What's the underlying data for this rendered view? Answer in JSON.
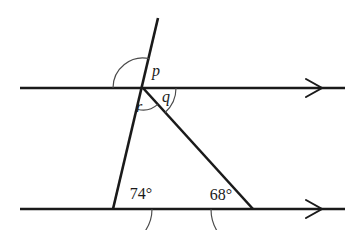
{
  "figure": {
    "type": "geometry-diagram",
    "background_color": "#ffffff",
    "line_color": "#1a1a1a",
    "arc_color": "#4a4a4a"
  },
  "lines": {
    "top_parallel": {
      "name": "top parallel line",
      "x1": 20,
      "y1": 88,
      "x2": 345,
      "y2": 88,
      "arrow_direction": "right",
      "arrow_x": 322,
      "arrow_count": 1
    },
    "bottom_parallel": {
      "name": "bottom parallel line",
      "x1": 20,
      "y1": 209,
      "x2": 345,
      "y2": 209,
      "arrow_direction": "right",
      "arrow_x": 322,
      "arrow_count": 1
    },
    "transversal": {
      "name": "transversal line",
      "x1": 158,
      "y1": 18,
      "x2": 113,
      "y2": 209
    },
    "right_leg": {
      "name": "right leg",
      "x1": 143,
      "y1": 88,
      "x2": 253,
      "y2": 209
    }
  },
  "points": {
    "intersection": {
      "x": 143,
      "y": 88,
      "label": "intersection on top line"
    },
    "bottom_left_vertex": {
      "x": 113,
      "y": 209,
      "label": "bottom left vertex"
    },
    "bottom_right_vertex": {
      "x": 253,
      "y": 209,
      "label": "bottom right vertex"
    }
  },
  "angles": [
    {
      "id": "p",
      "label": "p",
      "kind": "variable",
      "vertex": {
        "x": 143,
        "y": 88
      },
      "label_pos": {
        "x": 156,
        "y": 72
      },
      "arc_radius": 30,
      "start_deg": 180,
      "end_deg": 283,
      "description": "angle above top line, between transversal and line going right"
    },
    {
      "id": "q",
      "label": "q",
      "kind": "variable",
      "vertex": {
        "x": 143,
        "y": 88
      },
      "label_pos": {
        "x": 166,
        "y": 98
      },
      "arc_radius": 33,
      "start_deg": 0,
      "end_deg": 48,
      "description": "angle below top line, between line going right and right leg"
    },
    {
      "id": "r",
      "label": "r",
      "kind": "variable",
      "vertex": {
        "x": 143,
        "y": 88
      },
      "label_pos": {
        "x": 139,
        "y": 108
      },
      "arc_radius": 22,
      "start_deg": 48,
      "end_deg": 103,
      "description": "angle below top line, between right leg and transversal"
    },
    {
      "id": "angle74",
      "label": "74°",
      "kind": "measure",
      "value": 74,
      "unit": "degrees",
      "vertex": {
        "x": 113,
        "y": 209
      },
      "label_pos": {
        "x": 141,
        "y": 195
      },
      "arc_radius": 39,
      "start_deg": 0,
      "end_deg": 77,
      "description": "interior angle at bottom left vertex"
    },
    {
      "id": "angle68",
      "label": "68°",
      "kind": "measure",
      "value": 68,
      "unit": "degrees",
      "vertex": {
        "x": 253,
        "y": 209
      },
      "label_pos": {
        "x": 221,
        "y": 196
      },
      "arc_radius": 42,
      "start_deg": 132,
      "end_deg": 180,
      "description": "interior angle at bottom right vertex"
    }
  ],
  "labels": {
    "p": "p",
    "q": "q",
    "r": "r",
    "angle_74": "74°",
    "angle_68": "68°"
  }
}
